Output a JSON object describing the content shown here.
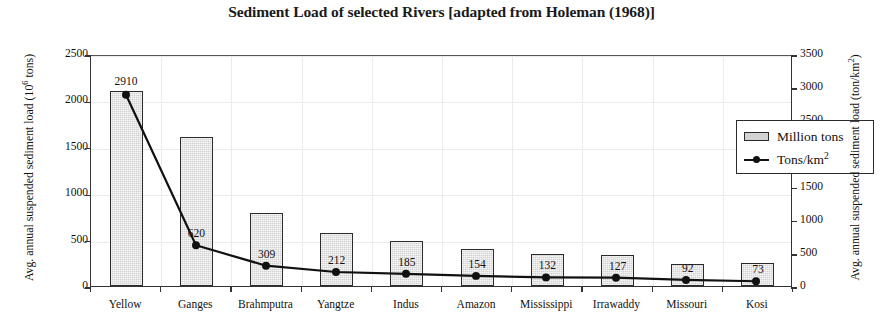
{
  "chart_data": {
    "type": "bar",
    "title": "Sediment Load of selected Rivers [adapted from Holeman (1968)]",
    "categories": [
      "Yellow",
      "Ganges",
      "Brahmputra",
      "Yangtze",
      "Indus",
      "Amazon",
      "Mississippi",
      "Irrawaddy",
      "Missouri",
      "Kosi"
    ],
    "series": [
      {
        "name": "Million tons",
        "type": "bar",
        "axis": "left",
        "values": [
          2100,
          1610,
          790,
          570,
          490,
          400,
          340,
          330,
          240,
          250
        ]
      },
      {
        "name": "Tons/km²",
        "type": "line",
        "axis": "right",
        "values": [
          2910,
          620,
          309,
          212,
          185,
          154,
          132,
          127,
          92,
          73
        ],
        "labels": [
          "2910",
          "620",
          "309",
          "212",
          "185",
          "154",
          "132",
          "127",
          "92",
          "73"
        ]
      }
    ],
    "xlabel": "",
    "ylabel_left": "Avg. annual suspended sediment load (10⁶ tons)",
    "ylabel_right": "Avg. annual suspended sediment load (ton/km²)",
    "ylim_left": [
      0,
      2500
    ],
    "ylim_right": [
      0,
      3500
    ],
    "yticks_left": [
      "0",
      "500",
      "1000",
      "1500",
      "2000",
      "2500"
    ],
    "yticks_right": [
      "0",
      "500",
      "1000",
      "1500",
      "2000",
      "2500",
      "3000",
      "3500"
    ],
    "grid": true,
    "legend_position": "upper right",
    "colors": {
      "bar_fill": "#d2d2d2",
      "bar_edge": "#2b2b2b",
      "line": "#111111",
      "grid": "#ebebeb",
      "axis": "#333333"
    }
  },
  "axis": {
    "left_title_main": "Avg. annual suspended sediment load (10",
    "left_title_sup": "6",
    "left_title_tail": " tons)",
    "right_title_main": "Avg. annual suspended sediment load (ton/km",
    "right_title_sup": "2",
    "right_title_tail": ")"
  },
  "legend": {
    "items": [
      {
        "label": "Million tons",
        "marker": "bar-swatch"
      },
      {
        "label": "Tons/km",
        "sup": "2",
        "marker": "line-marker-swatch"
      }
    ]
  }
}
